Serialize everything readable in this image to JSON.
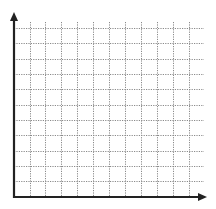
{
  "diagram": {
    "type": "blank-coordinate-grid",
    "quadrant": "first",
    "colors": {
      "background": "#ffffff",
      "axis": "#222222",
      "grid": "#8a8a8a"
    },
    "origin": {
      "x": 14,
      "y": 197
    },
    "x_axis": {
      "end_x": 207,
      "arrow": true
    },
    "y_axis": {
      "end_y": 12,
      "arrow": true
    },
    "vertical_grid_lines": [
      30,
      45,
      61,
      77,
      93,
      109,
      125,
      141,
      157,
      173,
      189
    ],
    "horizontal_grid_lines": [
      28,
      43,
      59,
      74,
      89,
      105,
      120,
      135,
      151,
      166,
      181
    ],
    "grid_extent": {
      "top": 22,
      "right": 204
    },
    "grid_style": "dotted"
  }
}
